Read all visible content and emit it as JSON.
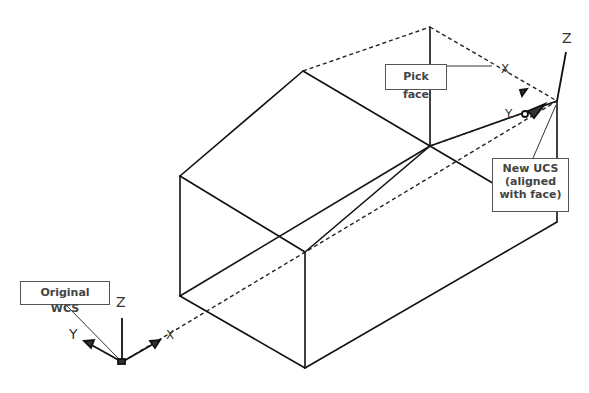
{
  "callouts": {
    "pick_face": "Pick face",
    "new_ucs": [
      "New UCS",
      "(aligned",
      "with face)"
    ],
    "original_wcs": "Original WCS"
  },
  "axes": {
    "wcs": {
      "z": "Z",
      "y": "Y",
      "x": "X"
    },
    "ucs": {
      "z": "Z",
      "y": "Y",
      "x": "X"
    }
  },
  "colors": {
    "line": "#111111",
    "callout_border": "#555555",
    "text": "#444444"
  }
}
